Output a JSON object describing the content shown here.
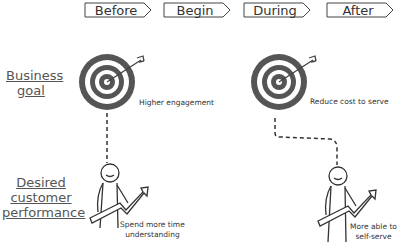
{
  "stages": [
    {
      "label": "Before"
    },
    {
      "label": "Begin"
    },
    {
      "label": "During"
    },
    {
      "label": "After"
    }
  ],
  "rows": {
    "business_goal": {
      "label_line1": "Business",
      "label_line2": "goal"
    },
    "customer_performance": {
      "label_line1": "Desired",
      "label_line2": "customer",
      "label_line3": "performance"
    }
  },
  "columns": [
    {
      "goal_note": "Higher engagement",
      "performance_note_line1": "Spend more time",
      "performance_note_line2": "understanding"
    },
    {
      "goal_note": "Reduce cost to serve",
      "performance_note_line1": "More able to",
      "performance_note_line2": "self-serve"
    }
  ],
  "colors": {
    "ink": "#333333",
    "target_dark": "#555555"
  }
}
